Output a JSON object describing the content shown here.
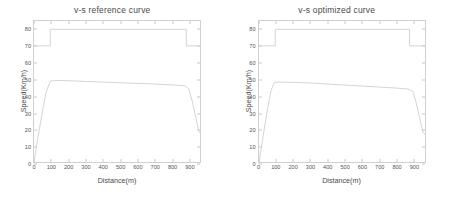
{
  "figure": {
    "width": 449,
    "height": 204,
    "background": "#ffffff",
    "line_color": "#cfcfcf",
    "axis_color": "#d0d0d0",
    "text_color": "#4a4a4a"
  },
  "chart_data": [
    {
      "type": "line",
      "title": "v-s reference curve",
      "xlabel": "Distance(m)",
      "ylabel": "Speed(Km/h)",
      "xlim": [
        0,
        970
      ],
      "ylim": [
        0,
        85
      ],
      "xticks": [
        0,
        100,
        200,
        300,
        400,
        500,
        600,
        700,
        800,
        900
      ],
      "yticks": [
        0,
        10,
        20,
        30,
        40,
        50,
        60,
        70,
        80
      ],
      "grid": false,
      "legend": "none",
      "series": [
        {
          "name": "speed limit",
          "style": "step",
          "color": "#cfcfcf",
          "x": [
            0,
            95,
            95,
            890,
            890,
            970
          ],
          "y": [
            70,
            70,
            80,
            80,
            70,
            70
          ]
        },
        {
          "name": "reference speed",
          "style": "line",
          "color": "#cfcfcf",
          "x": [
            0,
            20,
            45,
            70,
            95,
            120,
            200,
            300,
            400,
            500,
            600,
            700,
            800,
            880,
            905,
            925,
            945,
            962,
            970
          ],
          "y": [
            0,
            13,
            28,
            42,
            48.6,
            49.2,
            49.0,
            48.6,
            48.2,
            47.8,
            47.4,
            47.0,
            46.5,
            46.0,
            44.0,
            36.5,
            27.0,
            19.0,
            17.5
          ]
        }
      ]
    },
    {
      "type": "line",
      "title": "v-s optimized curve",
      "xlabel": "Distance(m)",
      "ylabel": "Speed(Km/h)",
      "xlim": [
        0,
        970
      ],
      "ylim": [
        0,
        85
      ],
      "xticks": [
        0,
        100,
        200,
        300,
        400,
        500,
        600,
        700,
        800,
        900
      ],
      "yticks": [
        0,
        10,
        20,
        30,
        40,
        50,
        60,
        70,
        80
      ],
      "grid": false,
      "legend": "none",
      "series": [
        {
          "name": "speed limit",
          "style": "step",
          "color": "#cfcfcf",
          "x": [
            0,
            95,
            95,
            880,
            880,
            970
          ],
          "y": [
            70,
            70,
            80,
            80,
            70,
            70
          ]
        },
        {
          "name": "optimized speed",
          "style": "line",
          "color": "#cfcfcf",
          "x": [
            0,
            20,
            45,
            70,
            90,
            120,
            200,
            300,
            400,
            500,
            600,
            700,
            800,
            870,
            900,
            920,
            940,
            958,
            970
          ],
          "y": [
            0,
            13,
            29,
            43,
            48.0,
            48.2,
            48.0,
            47.6,
            47.0,
            46.4,
            45.8,
            45.2,
            44.6,
            44.0,
            42.5,
            35.0,
            26.0,
            18.0,
            16.5
          ]
        }
      ]
    }
  ]
}
